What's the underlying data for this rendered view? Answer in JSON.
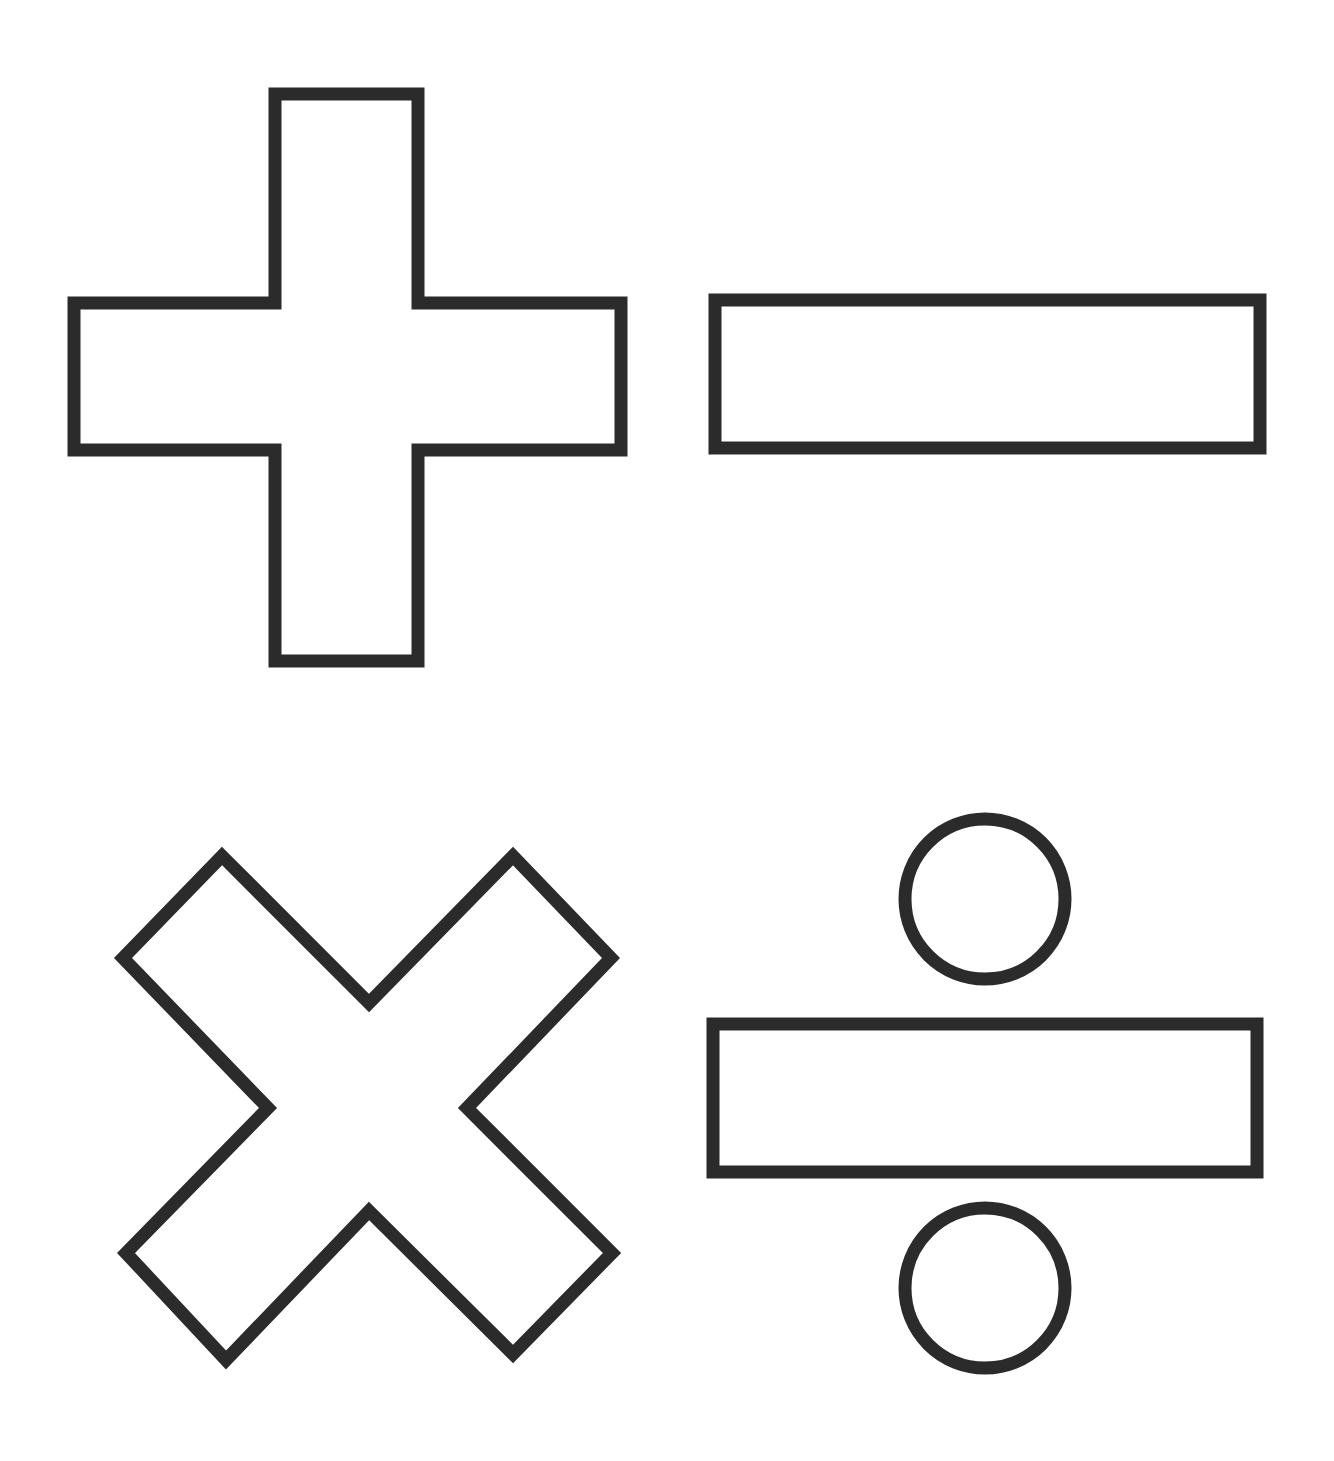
{
  "page": {
    "background": "#ffffff",
    "stroke_color": "#2b2b2b"
  },
  "symbols": [
    {
      "name": "plus",
      "icon": "plus-icon"
    },
    {
      "name": "minus",
      "icon": "minus-icon"
    },
    {
      "name": "multiply",
      "icon": "multiply-icon"
    },
    {
      "name": "divide",
      "icon": "divide-icon"
    }
  ]
}
